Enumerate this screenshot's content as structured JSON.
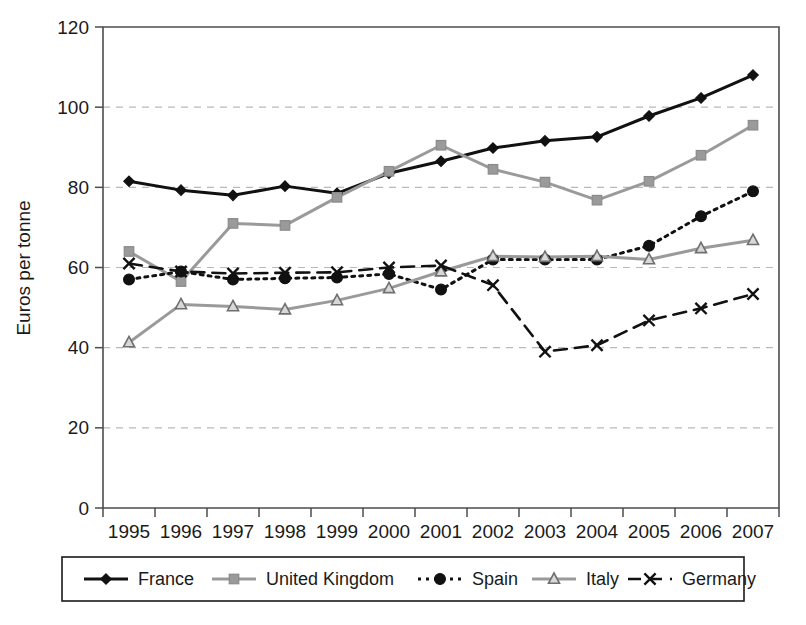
{
  "chart_data": {
    "type": "line",
    "title": "",
    "xlabel": "",
    "ylabel": "Euros per tonne",
    "categories": [
      "1995",
      "1996",
      "1997",
      "1998",
      "1999",
      "2000",
      "2001",
      "2002",
      "2003",
      "2004",
      "2005",
      "2006",
      "2007"
    ],
    "x": [
      1995,
      1996,
      1997,
      1998,
      1999,
      2000,
      2001,
      2002,
      2003,
      2004,
      2005,
      2006,
      2007
    ],
    "ylim": [
      0,
      120
    ],
    "yticks": [
      0,
      20,
      40,
      60,
      80,
      100,
      120
    ],
    "grid": "horizontal-dashed",
    "legend_position": "bottom",
    "series": [
      {
        "name": "France",
        "color": "#111111",
        "line_style": "solid",
        "marker": "diamond",
        "values": [
          81.5,
          79.3,
          78.0,
          80.3,
          78.5,
          83.5,
          86.5,
          89.8,
          91.6,
          92.6,
          97.8,
          102.3,
          108.0
        ]
      },
      {
        "name": "United Kingdom",
        "color": "#9a9a9a",
        "line_style": "solid",
        "marker": "square",
        "values": [
          64.0,
          56.5,
          71.0,
          70.5,
          77.5,
          84.0,
          90.5,
          84.5,
          81.3,
          76.8,
          81.5,
          88.0,
          95.5
        ]
      },
      {
        "name": "Spain",
        "color": "#111111",
        "line_style": "dotted",
        "marker": "circle",
        "values": [
          57.0,
          59.0,
          57.0,
          57.3,
          57.5,
          58.4,
          54.5,
          62.0,
          62.0,
          62.0,
          65.4,
          72.8,
          79.0
        ]
      },
      {
        "name": "Italy",
        "color": "#9a9a9a",
        "line_style": "solid",
        "marker": "triangle",
        "values": [
          41.3,
          50.8,
          50.3,
          49.5,
          51.8,
          54.8,
          59.0,
          62.8,
          62.6,
          62.8,
          62.0,
          64.8,
          66.8
        ]
      },
      {
        "name": "Germany",
        "color": "#111111",
        "line_style": "dashed",
        "marker": "x",
        "values": [
          61.0,
          59.0,
          58.5,
          58.7,
          58.8,
          60.0,
          60.5,
          55.6,
          39.0,
          40.6,
          46.8,
          49.8,
          53.4
        ]
      }
    ]
  },
  "legend": {
    "items": [
      {
        "label": "France",
        "marker": "diamond",
        "color": "#111111",
        "line_style": "solid"
      },
      {
        "label": "United Kingdom",
        "marker": "square",
        "color": "#9a9a9a",
        "line_style": "solid"
      },
      {
        "label": "Spain",
        "marker": "circle",
        "color": "#111111",
        "line_style": "dotted"
      },
      {
        "label": "Italy",
        "marker": "triangle",
        "color": "#9a9a9a",
        "line_style": "solid"
      },
      {
        "label": "Germany",
        "marker": "x",
        "color": "#111111",
        "line_style": "dashed"
      }
    ]
  },
  "colors": {
    "black_series": "#111111",
    "gray_series": "#9a9a9a",
    "axis": "#4d4d4d",
    "gridline": "#b9b9b9",
    "background": "#ffffff"
  }
}
